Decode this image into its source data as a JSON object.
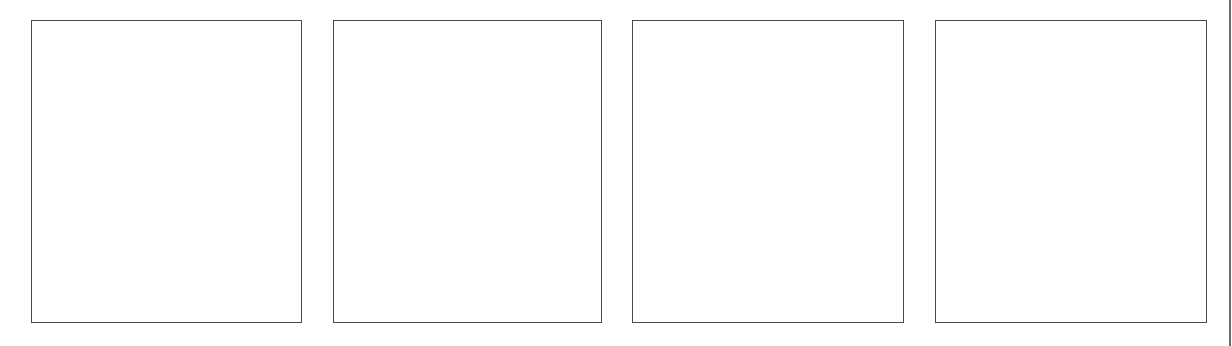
{
  "layout": {
    "type": "four-panel blank strip",
    "panel_count": 4
  },
  "panels": [
    {
      "id": 1,
      "label": ""
    },
    {
      "id": 2,
      "label": ""
    },
    {
      "id": 3,
      "label": ""
    },
    {
      "id": 4,
      "label": ""
    }
  ],
  "colors": {
    "background": "#ffffff",
    "panel_border": "#4a4a4a",
    "right_rule": "#6a6a6a"
  }
}
